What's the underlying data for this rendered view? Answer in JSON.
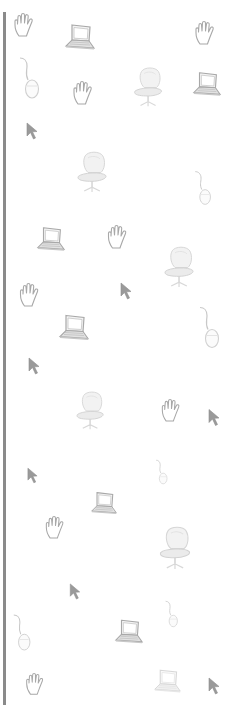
{
  "page": {
    "colors": {
      "background": "#ffffff",
      "left_rule": "#8a8a8a",
      "icon_stroke": "#a8a8a8",
      "icon_faint": "#d4d4d4",
      "cursor_fill": "#9a9a9a"
    }
  },
  "icons": [
    {
      "type": "hand-icon",
      "x": 13,
      "y": 12,
      "w": 22,
      "h": 26
    },
    {
      "type": "laptop-icon",
      "x": 64,
      "y": 22,
      "w": 32,
      "h": 32
    },
    {
      "type": "hand-icon",
      "x": 194,
      "y": 20,
      "w": 22,
      "h": 26
    },
    {
      "type": "mouse-icon",
      "x": 18,
      "y": 56,
      "w": 24,
      "h": 44
    },
    {
      "type": "hand-icon",
      "x": 72,
      "y": 80,
      "w": 22,
      "h": 26
    },
    {
      "type": "chair-icon",
      "x": 133,
      "y": 65,
      "w": 32,
      "h": 45
    },
    {
      "type": "laptop-icon",
      "x": 192,
      "y": 70,
      "w": 30,
      "h": 30
    },
    {
      "type": "cursor-icon",
      "x": 26,
      "y": 122,
      "w": 12,
      "h": 18
    },
    {
      "type": "chair-icon",
      "x": 74,
      "y": 150,
      "w": 38,
      "h": 45
    },
    {
      "type": "mouse-icon",
      "x": 187,
      "y": 170,
      "w": 33,
      "h": 36
    },
    {
      "type": "laptop-icon",
      "x": 36,
      "y": 224,
      "w": 30,
      "h": 32
    },
    {
      "type": "hand-icon",
      "x": 106,
      "y": 224,
      "w": 23,
      "h": 26
    },
    {
      "type": "chair-icon",
      "x": 163,
      "y": 245,
      "w": 34,
      "h": 45
    },
    {
      "type": "hand-icon",
      "x": 18,
      "y": 282,
      "w": 23,
      "h": 26
    },
    {
      "type": "cursor-icon",
      "x": 120,
      "y": 282,
      "w": 12,
      "h": 18
    },
    {
      "type": "laptop-icon",
      "x": 58,
      "y": 312,
      "w": 32,
      "h": 33
    },
    {
      "type": "mouse-icon",
      "x": 198,
      "y": 305,
      "w": 24,
      "h": 45
    },
    {
      "type": "cursor-icon",
      "x": 28,
      "y": 357,
      "w": 12,
      "h": 18
    },
    {
      "type": "chair-icon",
      "x": 75,
      "y": 390,
      "w": 32,
      "h": 42
    },
    {
      "type": "hand-icon",
      "x": 159,
      "y": 398,
      "w": 24,
      "h": 25
    },
    {
      "type": "cursor-icon",
      "x": 208,
      "y": 408,
      "w": 12,
      "h": 19
    },
    {
      "type": "cursor-icon",
      "x": 27,
      "y": 467,
      "w": 11,
      "h": 17
    },
    {
      "type": "mouse-icon",
      "x": 142,
      "y": 459,
      "w": 40,
      "h": 26
    },
    {
      "type": "laptop-icon",
      "x": 90,
      "y": 488,
      "w": 28,
      "h": 32
    },
    {
      "type": "hand-icon",
      "x": 44,
      "y": 515,
      "w": 22,
      "h": 25
    },
    {
      "type": "chair-icon",
      "x": 158,
      "y": 525,
      "w": 36,
      "h": 47
    },
    {
      "type": "cursor-icon",
      "x": 69,
      "y": 583,
      "w": 12,
      "h": 17
    },
    {
      "type": "mouse-icon",
      "x": 152,
      "y": 600,
      "w": 40,
      "h": 28
    },
    {
      "type": "mouse-icon",
      "x": 12,
      "y": 612,
      "w": 21,
      "h": 41
    },
    {
      "type": "laptop-icon",
      "x": 114,
      "y": 617,
      "w": 30,
      "h": 31
    },
    {
      "type": "hand-icon",
      "x": 24,
      "y": 672,
      "w": 22,
      "h": 24
    },
    {
      "type": "laptop-icon",
      "x": 153,
      "y": 667,
      "w": 29,
      "h": 30,
      "faint": true
    },
    {
      "type": "cursor-icon",
      "x": 208,
      "y": 677,
      "w": 12,
      "h": 18
    }
  ]
}
